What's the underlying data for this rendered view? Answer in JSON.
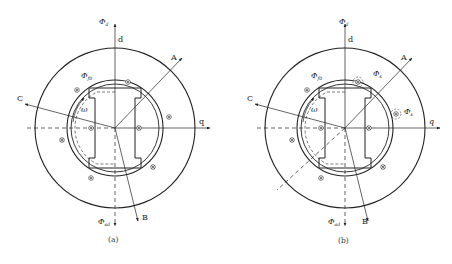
{
  "figure": {
    "panels": [
      {
        "id": "a",
        "caption": "(a)",
        "center": [
          115,
          128
        ],
        "labels": {
          "phi_d": "Φ",
          "phi_d_sub": "d",
          "d_axis": "d",
          "q_axis": "q",
          "phase_a": "A",
          "phase_b": "B",
          "phase_c": "C",
          "phi_f": "Φ",
          "phi_f_sub": "f0",
          "omega": "ω",
          "phi_ad": "Φ",
          "phi_ad_sub": "ad"
        }
      },
      {
        "id": "b",
        "caption": "(b)",
        "center": [
          345,
          128
        ],
        "labels": {
          "phi_d": "Φ",
          "phi_d_sub": "d",
          "d_axis": "d",
          "q_axis": "q",
          "phase_a": "A",
          "phase_b": "B",
          "phase_c": "C",
          "phi_f": "Φ",
          "phi_f_sub": "f0",
          "omega": "ω",
          "phi_s1": "Φ",
          "phi_s1_sub": "s",
          "phi_s2": "Φ",
          "phi_s2_sub": "s",
          "phi_ad": "Φ",
          "phi_ad_sub": "ad"
        }
      }
    ],
    "colors": {
      "line": "#222222",
      "background": "#ffffff"
    }
  }
}
